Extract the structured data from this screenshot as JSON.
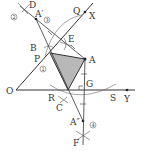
{
  "diagram": {
    "type": "geometry-construction",
    "colors": {
      "line": "#333333",
      "fill": "#b8b8b8",
      "arc": "#666666"
    },
    "points": {
      "O": {
        "label": "O",
        "x": 16,
        "y": 90
      },
      "A": {
        "label": "A",
        "x": 85,
        "y": 59
      },
      "A_prime": {
        "label": "A′",
        "x": 36,
        "y": 20
      },
      "A_double_prime": {
        "label": "A″",
        "x": 83,
        "y": 121
      },
      "B": {
        "label": "B",
        "x": 42,
        "y": 47
      },
      "P": {
        "label": "P",
        "x": 46,
        "y": 58
      },
      "C": {
        "label": "C",
        "x": 61,
        "y": 104
      },
      "D": {
        "label": "D",
        "x": 26,
        "y": 7
      },
      "E": {
        "label": "E",
        "x": 69,
        "y": 40
      },
      "F": {
        "label": "F",
        "x": 82,
        "y": 140
      },
      "G": {
        "label": "G",
        "x": 87,
        "y": 83
      },
      "Q": {
        "label": "Q",
        "x": 64,
        "y": 13
      },
      "R": {
        "label": "R",
        "x": 50,
        "y": 98
      },
      "S": {
        "label": "S",
        "x": 113,
        "y": 98
      },
      "X": {
        "label": "X",
        "x": 107,
        "y": 16
      },
      "Y": {
        "label": "Y",
        "x": 126,
        "y": 99
      }
    },
    "circled_numbers": [
      {
        "label": "①",
        "x": 42,
        "y": 70
      },
      {
        "label": "②",
        "x": 14,
        "y": 17
      },
      {
        "label": "③",
        "x": 47,
        "y": 22
      },
      {
        "label": "④",
        "x": 93,
        "y": 127
      }
    ],
    "shaded_triangle": "Triangle formed by P-intersection, A, and point on OY"
  }
}
